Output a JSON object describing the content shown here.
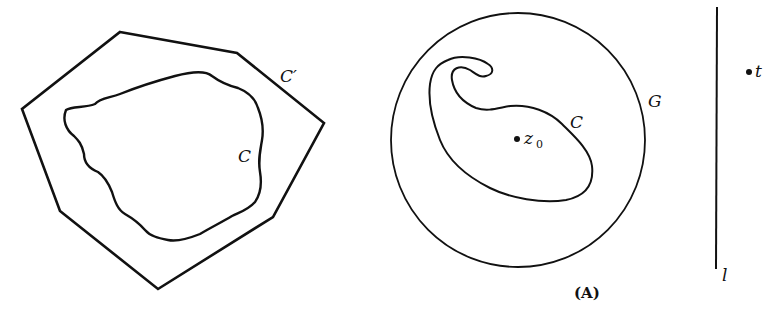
{
  "figure": {
    "left_panel": {
      "outer_polygon_label": "C′",
      "inner_curve_label": "C"
    },
    "middle_panel": {
      "circle_label": "G",
      "curve_label": "C",
      "point_label": "z",
      "point_subscript": "0",
      "caption": "(A)"
    },
    "right_panel": {
      "line_label": "l",
      "point_label": "t"
    }
  },
  "colors": {
    "stroke": "#111111",
    "background": "#ffffff"
  }
}
